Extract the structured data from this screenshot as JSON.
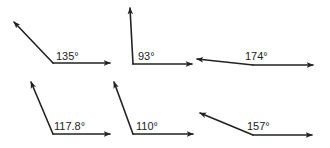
{
  "diagram": {
    "title": "",
    "stroke_color": "#222222",
    "background": "#ffffff",
    "angles": [
      {
        "label": "135°",
        "measure": 135,
        "vertex": [
          53,
          63
        ],
        "ray_a": [
          14,
          22
        ],
        "ray_b": [
          110,
          63
        ],
        "label_pos": [
          56,
          60
        ]
      },
      {
        "label": "93°",
        "measure": 93,
        "vertex": [
          133,
          64
        ],
        "ray_a": [
          130,
          8
        ],
        "ray_b": [
          192,
          64
        ],
        "label_pos": [
          138,
          60
        ]
      },
      {
        "label": "174°",
        "measure": 174,
        "vertex": [
          253,
          65
        ],
        "ray_a": [
          197,
          59
        ],
        "ray_b": [
          313,
          65
        ],
        "label_pos": [
          245,
          60
        ]
      },
      {
        "label": "117.8°",
        "measure": 117.8,
        "vertex": [
          53,
          134
        ],
        "ray_a": [
          31,
          82
        ],
        "ray_b": [
          110,
          134
        ],
        "label_pos": [
          54,
          130
        ]
      },
      {
        "label": "110°",
        "measure": 110,
        "vertex": [
          133,
          134
        ],
        "ray_a": [
          114,
          82
        ],
        "ray_b": [
          193,
          134
        ],
        "label_pos": [
          136,
          130
        ]
      },
      {
        "label": "157°",
        "measure": 157,
        "vertex": [
          253,
          135
        ],
        "ray_a": [
          200,
          113
        ],
        "ray_b": [
          312,
          135
        ],
        "label_pos": [
          247,
          130
        ]
      }
    ]
  }
}
